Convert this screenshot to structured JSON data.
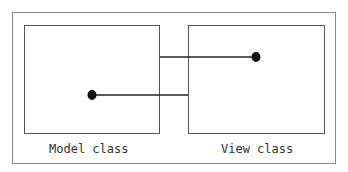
{
  "diagram": {
    "boxes": [
      {
        "id": "model",
        "label": "Model class"
      },
      {
        "id": "view",
        "label": "View class"
      }
    ],
    "connections": [
      {
        "from": "model",
        "to": "view",
        "description": "line from dot inside Model class to left edge of View class"
      },
      {
        "from": "view",
        "to": "model",
        "description": "line from dot inside View class to right edge of Model class"
      }
    ],
    "colors": {
      "line": "#222222",
      "box_border": "#555555",
      "frame_border": "#8a8a8a",
      "text": "#333333"
    }
  }
}
